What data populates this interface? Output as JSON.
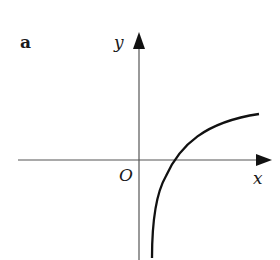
{
  "figure": {
    "panel_label": "a",
    "axes": {
      "x_label": "x",
      "y_label": "y",
      "origin_label": "O"
    },
    "curve": {
      "description": "increasing concave curve with vertical asymptote just right of y-axis, crossing x-axis right of origin (logarithmic-like)",
      "color": "#111111"
    },
    "colors": {
      "background": "#ffffff",
      "axis": "#555555",
      "text": "#1a1a1a"
    }
  }
}
